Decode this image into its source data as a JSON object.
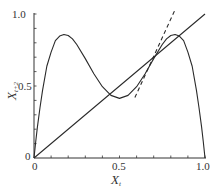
{
  "chart_data": {
    "type": "line",
    "title": "",
    "xlabel": "X_t",
    "ylabel": "X_{t+2}",
    "xlabel_main": "X",
    "xlabel_sub": "t",
    "ylabel_main": "X",
    "ylabel_sub": "t+2",
    "xlim": [
      0,
      1.0
    ],
    "ylim": [
      0,
      1.0
    ],
    "x_ticks": [
      0,
      0.5,
      1.0
    ],
    "x_tick_labels": [
      "0",
      "0.5",
      "1.0"
    ],
    "y_ticks": [
      0,
      0.5,
      1.0
    ],
    "y_tick_labels": [
      "0",
      "0.5",
      "1.0"
    ],
    "minor_tick_step": 0.1,
    "grid": false,
    "legend": null,
    "series": [
      {
        "name": "second-iterate map f(f(x)), logistic r≈3.44",
        "style": "solid",
        "x": [
          0,
          0.01,
          0.02,
          0.035,
          0.05,
          0.075,
          0.1,
          0.125,
          0.15,
          0.175,
          0.2,
          0.225,
          0.25,
          0.3,
          0.35,
          0.4,
          0.45,
          0.5,
          0.55,
          0.6,
          0.65,
          0.7,
          0.75,
          0.775,
          0.8,
          0.825,
          0.85,
          0.875,
          0.9,
          0.925,
          0.95,
          0.965,
          0.98,
          0.99,
          1.0
        ],
        "y": [
          0,
          0.113,
          0.216,
          0.349,
          0.47,
          0.637,
          0.735,
          0.815,
          0.847,
          0.858,
          0.851,
          0.827,
          0.788,
          0.69,
          0.585,
          0.495,
          0.435,
          0.414,
          0.435,
          0.495,
          0.585,
          0.69,
          0.788,
          0.827,
          0.851,
          0.858,
          0.847,
          0.815,
          0.735,
          0.637,
          0.47,
          0.349,
          0.216,
          0.113,
          0
        ]
      },
      {
        "name": "identity line y = x",
        "style": "solid",
        "x": [
          0,
          1.0
        ],
        "y": [
          0,
          1.0
        ]
      },
      {
        "name": "tangent at fixed point",
        "style": "dashed",
        "x": [
          0.59,
          0.825
        ],
        "y": [
          0.42,
          1.03
        ]
      }
    ]
  }
}
